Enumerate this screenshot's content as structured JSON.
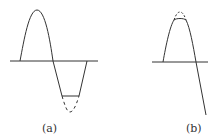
{
  "figure": {
    "panels": [
      {
        "id": "a",
        "label": "(a)",
        "description": "Sine wave with negative half-cycle clipped flat; dashed line shows the removed peak",
        "axis": {
          "y": 61,
          "x_start": 10,
          "x_end": 98
        },
        "waveform": {
          "peak": [
            37,
            10
          ],
          "zero_crossing": [
            53,
            61
          ],
          "clip_level": 96,
          "clip_from_x": 62,
          "clip_to_x": 79,
          "end": [
            87,
            61
          ],
          "dashed_trough": [
            70,
            112
          ]
        }
      },
      {
        "id": "b",
        "label": "(b)",
        "description": "Sine wave with positive peak clipped; dashed line shows the removed tip",
        "axis": {
          "y": 62,
          "x_start": 152,
          "x_end": 208
        },
        "waveform": {
          "start": [
            163,
            62
          ],
          "clip_level": 20,
          "dashed_peak": [
            180,
            12
          ],
          "zero_crossing": [
            196,
            62
          ],
          "end": [
            206,
            115
          ]
        }
      }
    ],
    "colors": {
      "stroke": "#333333",
      "background": "#ffffff"
    }
  }
}
